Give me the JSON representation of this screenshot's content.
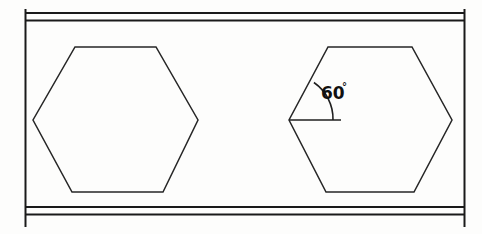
{
  "figure": {
    "background_color": "#fdfdfc",
    "line_color": "#1a1a1a",
    "annotation": {
      "angle_value": "60",
      "degree_symbol": "°",
      "full_label": "60°"
    },
    "band": {
      "name": "horizontal-band",
      "left_edge_x": 25,
      "right_edge_x": 465,
      "top_rail_1_y": 13,
      "top_rail_2_y": 20,
      "bottom_rail_1_y": 207,
      "bottom_rail_2_y": 214,
      "vertical_top_y": 9,
      "vertical_bottom_y": 227
    },
    "shapes": [
      {
        "name": "hexagon-left",
        "label": "Left hexagon",
        "center_x": 115.5,
        "center_y": 120,
        "half_width": 82.5,
        "top_y": 47,
        "bottom_y": 192,
        "top_edge_x1": 75,
        "top_edge_x2": 156,
        "bottom_edge_x1": 72,
        "bottom_edge_x2": 163,
        "annotated": false
      },
      {
        "name": "hexagon-right",
        "label": "Right hexagon with angle annotation",
        "center_x": 370.5,
        "center_y": 120,
        "half_width": 81.5,
        "top_y": 47,
        "bottom_y": 192,
        "top_edge_x1": 328,
        "top_edge_x2": 412,
        "bottom_edge_x1": 326,
        "bottom_edge_x2": 414,
        "annotated": true
      }
    ],
    "angle_marker": {
      "name": "angle-60-marker",
      "vertex_x": 289,
      "vertex_y": 120,
      "ray_end_x": 341,
      "ray_end_y": 120,
      "arc_radius": 44,
      "text_x": 322,
      "text_y": 99
    }
  }
}
